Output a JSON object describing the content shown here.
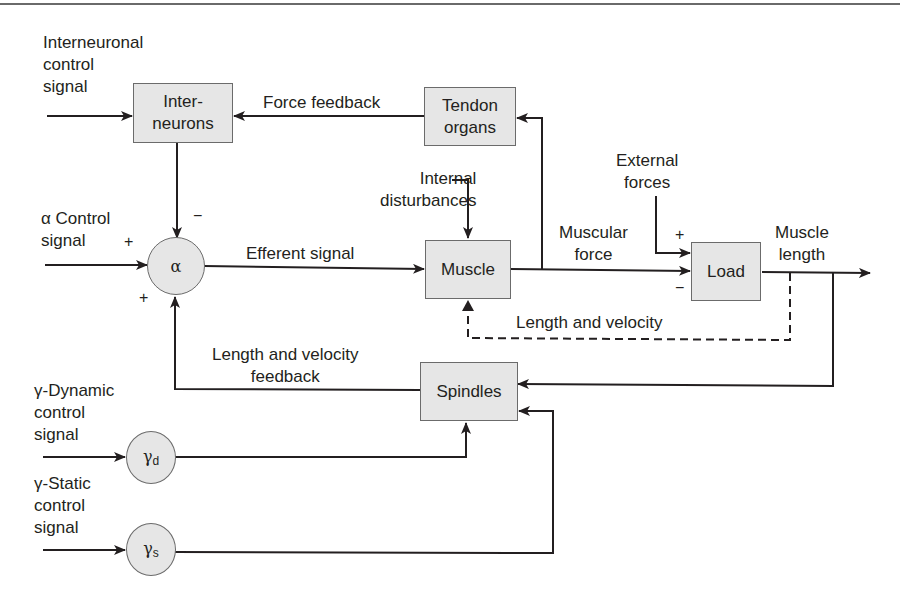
{
  "diagram": {
    "title": "",
    "blocks": {
      "interneurons": {
        "line1": "Inter-",
        "line2": "neurons"
      },
      "tendon_organs": {
        "line1": "Tendon",
        "line2": "organs"
      },
      "muscle": {
        "label": "Muscle"
      },
      "load": {
        "label": "Load"
      },
      "spindles": {
        "label": "Spindles"
      }
    },
    "nodes": {
      "alpha": {
        "symbol": "α"
      },
      "gamma_d": {
        "symbol": "γ",
        "subscript": "d"
      },
      "gamma_s": {
        "symbol": "γ",
        "subscript": "s"
      }
    },
    "inputs": {
      "interneuronal": {
        "line1": "Interneuronal",
        "line2": "control",
        "line3": "signal"
      },
      "alpha_control": {
        "line1": "α Control",
        "line2": "signal"
      },
      "gamma_dynamic": {
        "line1": "γ-Dynamic",
        "line2": "control",
        "line3": "signal"
      },
      "gamma_static": {
        "line1": "γ-Static",
        "line2": "control",
        "line3": "signal"
      },
      "internal_disturbances": {
        "line1": "Internal",
        "line2": "disturbances"
      },
      "external_forces": {
        "line1": "External",
        "line2": "forces"
      }
    },
    "edge_labels": {
      "force_feedback": "Force feedback",
      "efferent_signal": "Efferent signal",
      "muscular_force": {
        "line1": "Muscular",
        "line2": "force"
      },
      "muscle_length": {
        "line1": "Muscle",
        "line2": "length"
      },
      "length_velocity": "Length and velocity",
      "length_velocity_feedback": {
        "line1": "Length and velocity",
        "line2": "feedback"
      }
    },
    "signs": {
      "alpha_top": "−",
      "alpha_left": "+",
      "alpha_bottom": "+",
      "load_top": "+",
      "load_bottom": "−"
    }
  }
}
